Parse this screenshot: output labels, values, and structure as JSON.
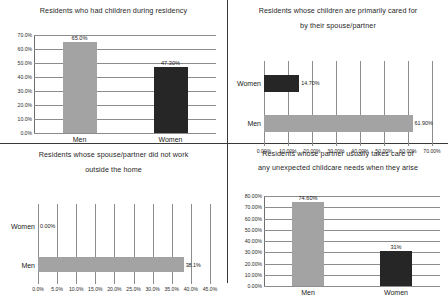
{
  "colors": {
    "men_bar": "#a3a3a3",
    "women_bar": "#262626",
    "gridline": "#8c8c8c",
    "divider": "#3a3a3a",
    "text": "#1a1a1a",
    "background": "#ffffff"
  },
  "chart_data": [
    {
      "id": "chart-residency-children",
      "type": "bar",
      "orientation": "vertical",
      "title": "Residents who had children during residency",
      "xlabel": "",
      "ylabel": "",
      "categories": [
        "Men",
        "Women"
      ],
      "values": [
        65.0,
        47.3
      ],
      "data_labels": [
        "65.0%",
        "47.30%"
      ],
      "ylim": [
        0,
        70
      ],
      "yticks": [
        0,
        10,
        20,
        30,
        40,
        50,
        60,
        70
      ],
      "ytick_labels": [
        "0.0%",
        "10.0%",
        "20.0%",
        "30.0%",
        "40.0%",
        "50.0%",
        "60.0%",
        "70.0%"
      ],
      "grid": true,
      "legend": "none",
      "series_colors": [
        "#a3a3a3",
        "#262626"
      ]
    },
    {
      "id": "chart-spouse-primary-care",
      "type": "bar",
      "orientation": "horizontal",
      "title": "Residents whose children are primarily cared for by their spouse/partner",
      "title_line_1": "Residents whose children are primarily cared for",
      "title_line_2": "by their spouse/partner",
      "xlabel": "",
      "ylabel": "",
      "categories": [
        "Women",
        "Men"
      ],
      "values": [
        14.7,
        61.9
      ],
      "data_labels": [
        "14.70%",
        "61.90%"
      ],
      "xlim": [
        0,
        70
      ],
      "xticks": [
        0,
        10,
        20,
        30,
        40,
        50,
        60,
        70
      ],
      "xtick_labels": [
        "0.00%",
        "10.00%",
        "20.00%",
        "30.00%",
        "40.00%",
        "50.00%",
        "60.00%",
        "70.00%"
      ],
      "grid": true,
      "legend": "none",
      "series_colors": [
        "#262626",
        "#a3a3a3"
      ]
    },
    {
      "id": "chart-spouse-not-working",
      "type": "bar",
      "orientation": "horizontal",
      "title": "Residents whose spouse/partner did not work outside the home",
      "title_line_1": "Residents whose spouse/partner did not work",
      "title_line_2": "outside the home",
      "xlabel": "",
      "ylabel": "",
      "categories": [
        "Women",
        "Men"
      ],
      "values": [
        0.0,
        38.1
      ],
      "data_labels": [
        "0.00%",
        "38.1%"
      ],
      "xlim": [
        0,
        45
      ],
      "xticks": [
        0,
        5,
        10,
        15,
        20,
        25,
        30,
        35,
        40,
        45
      ],
      "xtick_labels": [
        "0.0%",
        "5.0%",
        "10.0%",
        "15.0%",
        "20.0%",
        "25.0%",
        "30.0%",
        "35.0%",
        "40.0%",
        "45.0%"
      ],
      "grid": true,
      "legend": "none",
      "series_colors": [
        "#262626",
        "#a3a3a3"
      ]
    },
    {
      "id": "chart-unexpected-childcare",
      "type": "bar",
      "orientation": "vertical",
      "title": "Residents whose partner usually takes care of any unexpected childcare needs when they arise",
      "title_line_1": "Residents whose partner usually takes care of",
      "title_line_2": "any unexpected childcare needs when they arise",
      "xlabel": "",
      "ylabel": "",
      "categories": [
        "Men",
        "Women"
      ],
      "values": [
        74.6,
        31.0
      ],
      "data_labels": [
        "74.60%",
        "31%"
      ],
      "ylim": [
        0,
        80
      ],
      "yticks": [
        0,
        10,
        20,
        30,
        40,
        50,
        60,
        70,
        80
      ],
      "ytick_labels": [
        "0.00%",
        "10.00%",
        "20.00%",
        "30.00%",
        "40.00%",
        "50.00%",
        "60.00%",
        "70.00%",
        "80.00%"
      ],
      "grid": true,
      "legend": "none",
      "series_colors": [
        "#a3a3a3",
        "#262626"
      ]
    }
  ]
}
